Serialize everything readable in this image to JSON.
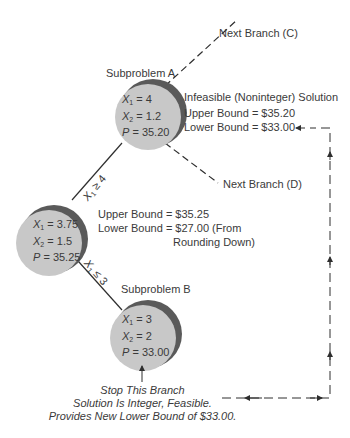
{
  "diagram": {
    "colors": {
      "node_fill": "#c8c8c8",
      "node_shadow": "#5a5a5a",
      "line": "#2e2e2e",
      "text": "#3a3a3a",
      "background": "#ffffff"
    },
    "next_branch_c": "Next Branch (C)",
    "next_branch_d": "Next Branch (D)",
    "subproblem_a": {
      "title": "Subproblem A",
      "x1_label": "X",
      "x1_sub": "1",
      "x1_value": "= 4",
      "x2_label": "X",
      "x2_sub": "2",
      "x2_value": "= 1.2",
      "p_label": "P",
      "p_value": "= 35.20",
      "status": "Infeasible (Noninteger) Solution",
      "upper_bound": "Upper Bound = $35.20",
      "lower_bound": "Lower Bound = $33.00"
    },
    "root": {
      "x1_label": "X",
      "x1_sub": "1",
      "x1_value": "= 3.75",
      "x2_label": "X",
      "x2_sub": "2",
      "x2_value": "= 1.5",
      "p_label": "P",
      "p_value": "= 35.25",
      "upper_bound": "Upper Bound = $35.25",
      "lower_bound": "Lower Bound = $27.00 (From",
      "lower_bound_cont": "Rounding Down)"
    },
    "subproblem_b": {
      "title": "Subproblem B",
      "x1_label": "X",
      "x1_sub": "1",
      "x1_value": "= 3",
      "x2_label": "X",
      "x2_sub": "2",
      "x2_value": "= 2",
      "p_label": "P",
      "p_value": "= 33.00",
      "note_line1": "Stop This Branch",
      "note_line2": "Solution Is Integer, Feasible.",
      "note_line3": "Provides New Lower Bound of $33.00."
    },
    "edges": {
      "to_a": {
        "var": "X",
        "sub": "1",
        "op": "≥ 4"
      },
      "to_b": {
        "var": "X",
        "sub": "1",
        "op": "≤ 3"
      }
    }
  }
}
